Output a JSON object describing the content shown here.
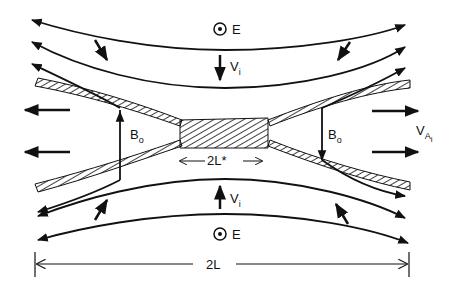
{
  "diagram": {
    "labels": {
      "e_top": "E",
      "e_bottom": "E",
      "vi_top": "V",
      "vi_top_sub": "i",
      "vi_bottom": "V",
      "vi_bottom_sub": "i",
      "b0_left": "B",
      "b0_left_sub": "o",
      "b0_right": "B",
      "b0_right_sub": "o",
      "outflow": "V",
      "outflow_sub": "A",
      "outflow_sub2": "i",
      "inner_length": "2L*",
      "outer_length": "2L"
    },
    "colors": {
      "ink": "#111111",
      "background": "#ffffff"
    }
  }
}
